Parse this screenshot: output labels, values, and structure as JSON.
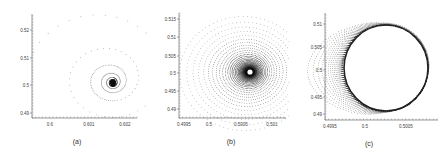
{
  "chart_data": [
    {
      "type": "scatter",
      "panel_label": "(a)",
      "description": "Phase portrait: trajectory spiraling inward to a stable focus",
      "x_ticks": [
        "0.6",
        "0.601",
        "0.602"
      ],
      "y_ticks": [
        "0.52",
        "0.51",
        "0.5",
        "0.49"
      ],
      "xlim": [
        0.5995,
        0.6023
      ],
      "ylim": [
        0.487,
        0.531
      ],
      "attractor": {
        "x": 0.6017,
        "y": 0.5015
      },
      "grid": false
    },
    {
      "type": "scatter",
      "panel_label": "(b)",
      "description": "Phase portrait: dense spiral converging to an equilibrium point",
      "x_ticks": [
        "0.4995",
        "0.5",
        "0.5005",
        "0.501"
      ],
      "y_ticks": [
        "0.515",
        "0.51",
        "0.505",
        "0.5",
        "0.495",
        "0.49"
      ],
      "xlim": [
        0.4995,
        0.5013
      ],
      "ylim": [
        0.487,
        0.517
      ],
      "attractor": {
        "x": 0.5007,
        "y": 0.5
      },
      "grid": false
    },
    {
      "type": "scatter",
      "panel_label": "(c)",
      "description": "Phase portrait: trajectory converging to a limit cycle",
      "x_ticks": [
        "0.4995",
        "0.5",
        "0.5005"
      ],
      "y_ticks": [
        "0.51",
        "0.505",
        "0.5",
        "0.495",
        "0.49"
      ],
      "xlim": [
        0.4995,
        0.5009
      ],
      "ylim": [
        0.4885,
        0.5115
      ],
      "limit_cycle": {
        "center_x": 0.5003,
        "center_y": 0.5,
        "radius_x": 0.0004,
        "radius_y": 0.0093
      },
      "grid": false
    }
  ],
  "captions": {
    "a": "(a)",
    "b": "(b)",
    "c": "(c)"
  }
}
